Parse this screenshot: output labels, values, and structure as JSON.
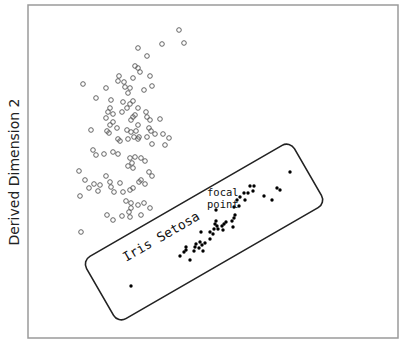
{
  "chart_data": {
    "type": "scatter",
    "title": "",
    "xlabel": "",
    "ylabel": "Derived Dimension 2",
    "grid": false,
    "legend": null,
    "frame": {
      "left": 28,
      "top": 5,
      "right": 398,
      "bottom": 338
    },
    "series": [
      {
        "name": "other-species",
        "marker": "open-circle",
        "color": "#555555",
        "points_px": [
          [
            179,
            30
          ],
          [
            162,
            44
          ],
          [
            184,
            43
          ],
          [
            138,
            48
          ],
          [
            147,
            56
          ],
          [
            135,
            66
          ],
          [
            138,
            68
          ],
          [
            83,
            84
          ],
          [
            106,
            88
          ],
          [
            119,
            76
          ],
          [
            118,
            81
          ],
          [
            133,
            78
          ],
          [
            140,
            72
          ],
          [
            124,
            82
          ],
          [
            125,
            87
          ],
          [
            150,
            76
          ],
          [
            144,
            90
          ],
          [
            152,
            86
          ],
          [
            130,
            88
          ],
          [
            128,
            93
          ],
          [
            96,
            98
          ],
          [
            111,
            100
          ],
          [
            123,
            102
          ],
          [
            130,
            104
          ],
          [
            133,
            101
          ],
          [
            108,
            112
          ],
          [
            110,
            108
          ],
          [
            106,
            118
          ],
          [
            113,
            114
          ],
          [
            122,
            112
          ],
          [
            127,
            108
          ],
          [
            138,
            108
          ],
          [
            146,
            112
          ],
          [
            147,
            117
          ],
          [
            133,
            117
          ],
          [
            131,
            120
          ],
          [
            135,
            115
          ],
          [
            138,
            125
          ],
          [
            150,
            120
          ],
          [
            160,
            119
          ],
          [
            113,
            122
          ],
          [
            110,
            125
          ],
          [
            91,
            130
          ],
          [
            107,
            131
          ],
          [
            109,
            133
          ],
          [
            117,
            128
          ],
          [
            127,
            130
          ],
          [
            131,
            132
          ],
          [
            136,
            131
          ],
          [
            149,
            128
          ],
          [
            151,
            131
          ],
          [
            155,
            134
          ],
          [
            163,
            134
          ],
          [
            169,
            138
          ],
          [
            134,
            137
          ],
          [
            139,
            137
          ],
          [
            138,
            139
          ],
          [
            147,
            137
          ],
          [
            152,
            144
          ],
          [
            165,
            145
          ],
          [
            128,
            139
          ],
          [
            120,
            141
          ],
          [
            118,
            139
          ],
          [
            93,
            150
          ],
          [
            96,
            155
          ],
          [
            104,
            154
          ],
          [
            113,
            152
          ],
          [
            118,
            154
          ],
          [
            130,
            158
          ],
          [
            135,
            157
          ],
          [
            141,
            158
          ],
          [
            145,
            161
          ],
          [
            128,
            166
          ],
          [
            132,
            163
          ],
          [
            133,
            168
          ],
          [
            106,
            176
          ],
          [
            110,
            182
          ],
          [
            139,
            182
          ],
          [
            141,
            180
          ],
          [
            145,
            184
          ],
          [
            152,
            176
          ],
          [
            149,
            172
          ],
          [
            79,
            171
          ],
          [
            85,
            180
          ],
          [
            89,
            188
          ],
          [
            94,
            184
          ],
          [
            98,
            191
          ],
          [
            80,
            196
          ],
          [
            100,
            185
          ],
          [
            111,
            187
          ],
          [
            114,
            192
          ],
          [
            123,
            192
          ],
          [
            130,
            190
          ],
          [
            133,
            188
          ],
          [
            126,
            201
          ],
          [
            131,
            203
          ],
          [
            131,
            208
          ],
          [
            129,
            212
          ],
          [
            138,
            205
          ],
          [
            144,
            203
          ],
          [
            150,
            208
          ],
          [
            141,
            215
          ],
          [
            130,
            217
          ],
          [
            122,
            216
          ],
          [
            113,
            220
          ],
          [
            107,
            215
          ],
          [
            81,
            232
          ],
          [
            120,
            183
          ]
        ]
      },
      {
        "name": "Iris Setosa",
        "marker": "filled-dot",
        "color": "#000000",
        "points_px": [
          [
            131,
            286
          ],
          [
            180,
            256
          ],
          [
            190,
            260
          ],
          [
            184,
            252
          ],
          [
            186,
            250
          ],
          [
            186,
            247
          ],
          [
            194,
            251
          ],
          [
            195,
            247
          ],
          [
            196,
            244
          ],
          [
            199,
            248
          ],
          [
            200,
            242
          ],
          [
            202,
            245
          ],
          [
            203,
            251
          ],
          [
            205,
            243
          ],
          [
            210,
            239
          ],
          [
            201,
            232
          ],
          [
            210,
            232
          ],
          [
            213,
            234
          ],
          [
            214,
            229
          ],
          [
            215,
            224
          ],
          [
            216,
            221
          ],
          [
            217,
            226
          ],
          [
            218,
            229
          ],
          [
            222,
            226
          ],
          [
            223,
            230
          ],
          [
            224,
            224
          ],
          [
            226,
            222
          ],
          [
            232,
            221
          ],
          [
            233,
            227
          ],
          [
            234,
            218
          ],
          [
            235,
            215
          ],
          [
            216,
            210
          ],
          [
            234,
            207
          ],
          [
            237,
            200
          ],
          [
            239,
            206
          ],
          [
            240,
            197
          ],
          [
            244,
            193
          ],
          [
            245,
            200
          ],
          [
            248,
            193
          ],
          [
            250,
            186
          ],
          [
            254,
            186
          ],
          [
            253,
            191
          ],
          [
            264,
            196
          ],
          [
            272,
            200
          ],
          [
            277,
            188
          ],
          [
            290,
            172
          ],
          [
            280,
            190
          ]
        ]
      }
    ],
    "annotations": [
      {
        "text": "Iris Setosa",
        "kind": "enclosure-label"
      },
      {
        "text": "focal",
        "kind": "point-label"
      },
      {
        "text": "point",
        "kind": "point-label"
      }
    ],
    "enclosure": {
      "shape": "rounded-rectangle",
      "rotation_deg": -30,
      "center_px": [
        204,
        232
      ],
      "width_px": 240,
      "height_px": 72
    }
  }
}
